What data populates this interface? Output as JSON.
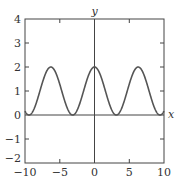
{
  "chart_data": {
    "type": "line",
    "title": "",
    "xlabel": "x",
    "ylabel": "y",
    "xlim": [
      -10,
      10
    ],
    "ylim": [
      -2,
      4
    ],
    "xticks": [
      "-10",
      "-5",
      "0",
      "5",
      "10"
    ],
    "yticks": [
      "-2",
      "-1",
      "0",
      "1",
      "2",
      "3",
      "4"
    ],
    "grid": false,
    "legend": null,
    "series": [
      {
        "name": "y = 1 + cos(x)",
        "x": [
          -10,
          -9.42,
          -8,
          -6.28,
          -5,
          -3.14,
          -2,
          0,
          2,
          3.14,
          5,
          6.28,
          8,
          9.42,
          10
        ],
        "values": [
          0.16,
          0,
          0.85,
          2,
          1.28,
          0,
          0.58,
          2,
          0.58,
          0,
          1.28,
          2,
          0.85,
          0,
          0.16
        ]
      }
    ],
    "colors": {
      "curve": "#555555",
      "axes": "#444444"
    }
  }
}
